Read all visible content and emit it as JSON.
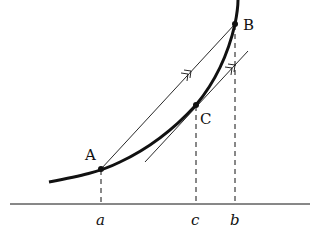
{
  "diagram": {
    "type": "mean-value-theorem",
    "points": [
      {
        "id": "A",
        "label": "A",
        "x": 101,
        "y": 169
      },
      {
        "id": "B",
        "label": "B",
        "x": 235,
        "y": 24
      },
      {
        "id": "C",
        "label": "C",
        "x": 196,
        "y": 105
      }
    ],
    "axis_labels": [
      {
        "id": "a",
        "label": "a",
        "x": 101
      },
      {
        "id": "c",
        "label": "c",
        "x": 196
      },
      {
        "id": "b",
        "label": "b",
        "x": 235
      }
    ],
    "elements": {
      "curve": "convex increasing curve y = f(x)",
      "chord": "secant line AB",
      "tangent": "tangent line at C, parallel to AB",
      "parallel_marks": "double arrowheads indicating AB ∥ tangent at C",
      "dashed_lines": "vertical dashed projections from A, C, B to x-axis"
    },
    "colors": {
      "stroke": "#111111",
      "background": "#ffffff"
    }
  }
}
